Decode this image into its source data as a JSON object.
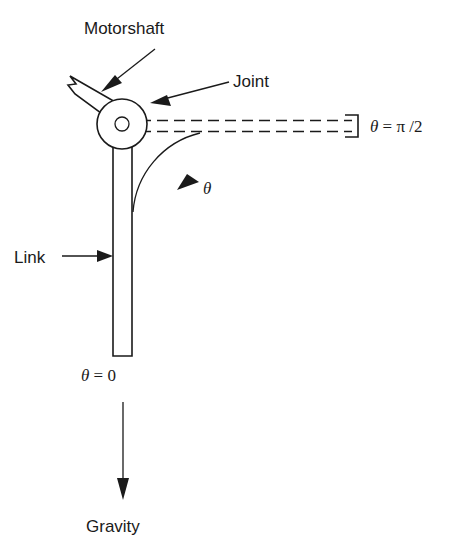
{
  "figure": {
    "title_visible": false,
    "background_color": "#ffffff",
    "ink_color": "#1a1a1a",
    "canvas": {
      "width": 449,
      "height": 545
    }
  },
  "labels": {
    "motorshaft": "Motorshaft",
    "joint": "Joint",
    "link": "Link",
    "gravity": "Gravity",
    "theta_arc": "θ",
    "theta_zero": "θ = 0",
    "theta_half_pi": "θ = π/2"
  },
  "annotations": [
    {
      "name": "motorshaft-callout",
      "label": "Motorshaft",
      "points_to": "motorshaft-bar"
    },
    {
      "name": "joint-callout",
      "label": "Joint",
      "points_to": "joint-hub"
    },
    {
      "name": "link-callout",
      "label": "Link",
      "points_to": "link-bar"
    },
    {
      "name": "gravity-callout",
      "label": "Gravity",
      "points_to": "down"
    }
  ],
  "geometry": {
    "joint_center": {
      "x": 122,
      "y": 124
    },
    "joint_outer_radius": 25,
    "joint_inner_radius": 7,
    "link_angle_deg": 0,
    "reference_angle_deg": 90
  },
  "icons": {
    "arrow_down": "gravity-arrow-icon",
    "arrow_callout": "callout-arrow-icon",
    "arc_arrow": "angle-arc-arrow-icon",
    "break_symbol": "shaft-break-icon"
  }
}
